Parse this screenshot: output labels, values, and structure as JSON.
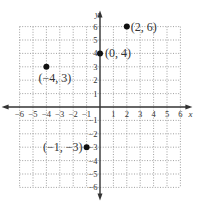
{
  "chart_data": {
    "type": "scatter",
    "title": "",
    "xlabel": "x",
    "ylabel": "y",
    "xlim": [
      -6,
      6
    ],
    "ylim": [
      -6,
      6
    ],
    "grid": true,
    "grid_style": "dotted",
    "x_ticks": [
      -6,
      -5,
      -4,
      -3,
      -2,
      -1,
      1,
      2,
      3,
      4,
      5,
      6
    ],
    "y_ticks": [
      -6,
      -5,
      -4,
      -3,
      -2,
      -1,
      1,
      2,
      3,
      4,
      5,
      6
    ],
    "points": [
      {
        "x": 2,
        "y": 6,
        "label": "(2, 6)"
      },
      {
        "x": 0,
        "y": 4,
        "label": "(0, 4)"
      },
      {
        "x": -4,
        "y": 3,
        "label": "(−4, 3)"
      },
      {
        "x": -1,
        "y": -3,
        "label": "(−1, −3)"
      }
    ],
    "colors": {
      "axis": "#333333",
      "grid": "#888888",
      "point": "#111111"
    }
  }
}
